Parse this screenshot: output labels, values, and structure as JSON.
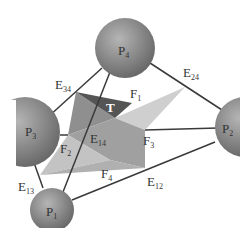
{
  "diagram": {
    "spheres": [
      {
        "id": "P1",
        "label": "P",
        "sub": "1"
      },
      {
        "id": "P2",
        "label": "P",
        "sub": "2"
      },
      {
        "id": "P3",
        "label": "P",
        "sub": "3"
      },
      {
        "id": "P4",
        "label": "P",
        "sub": "4"
      }
    ],
    "edges": [
      {
        "label": "E",
        "sub": "12"
      },
      {
        "label": "E",
        "sub": "13"
      },
      {
        "label": "E",
        "sub": "14"
      },
      {
        "label": "E",
        "sub": "24"
      },
      {
        "label": "E",
        "sub": "34"
      }
    ],
    "faces": [
      {
        "label": "F",
        "sub": "1"
      },
      {
        "label": "F",
        "sub": "2"
      },
      {
        "label": "F",
        "sub": "3"
      },
      {
        "label": "F",
        "sub": "4"
      }
    ],
    "center_label": "T",
    "colors": {
      "sphere": "#7a7a7a",
      "sphere_light": "#b0b0b0",
      "edge": "#3a3a3a",
      "face_dark": "#555555",
      "face_mid": "#9a9a9a",
      "face_light": "#c8c8c8"
    }
  }
}
